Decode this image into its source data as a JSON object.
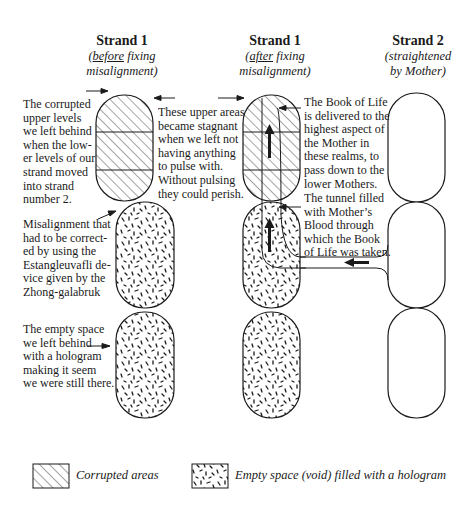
{
  "columns": [
    {
      "title": "Strand 1",
      "subtitle_pre": "(",
      "subtitle_em": "before",
      "subtitle_post": " fixing",
      "subtitle_line2": "misalignment)"
    },
    {
      "title": "Strand 1",
      "subtitle_pre": "(",
      "subtitle_em": "after",
      "subtitle_post": " fixing",
      "subtitle_line2": "misalignment)"
    },
    {
      "title": "Strand 2",
      "subtitle_line1": "(straightened",
      "subtitle_line2": "by Mother)"
    }
  ],
  "annotations": {
    "corrupted_upper": [
      "The corrupted",
      "upper levels",
      "we left behind",
      "when the low-",
      "er levels of our",
      "strand moved",
      "into strand",
      "number 2."
    ],
    "stagnant": [
      "These upper areas",
      "became stagnant",
      "when we left not",
      "having anything",
      "to pulse with.",
      "Without pulsing",
      "they could perish."
    ],
    "misalignment": [
      "Misalignment that",
      "had to be correct-",
      "ed by using the",
      "Estangleuvafli de-",
      "vice given by the",
      "Zhong-galabruk"
    ],
    "empty_space": [
      "The empty space",
      "we left behind",
      "with a hologram",
      "making it seem",
      "we were still there."
    ],
    "book_of_life": [
      "The Book of Life",
      "is delivered to the",
      "highest aspect of",
      "the Mother in",
      "these realms, to",
      "pass down to the",
      "lower Mothers."
    ],
    "tunnel": [
      "The tunnel filled",
      "with Mother’s",
      "Blood through",
      "which the Book",
      "of Life was taken."
    ]
  },
  "legend": [
    {
      "pattern": "hatched",
      "label": "Corrupted areas"
    },
    {
      "pattern": "dotted",
      "label": "Empty space (void) filled with a hologram"
    }
  ],
  "colors": {
    "ink": "#1a1a1a",
    "background": "#ffffff"
  }
}
